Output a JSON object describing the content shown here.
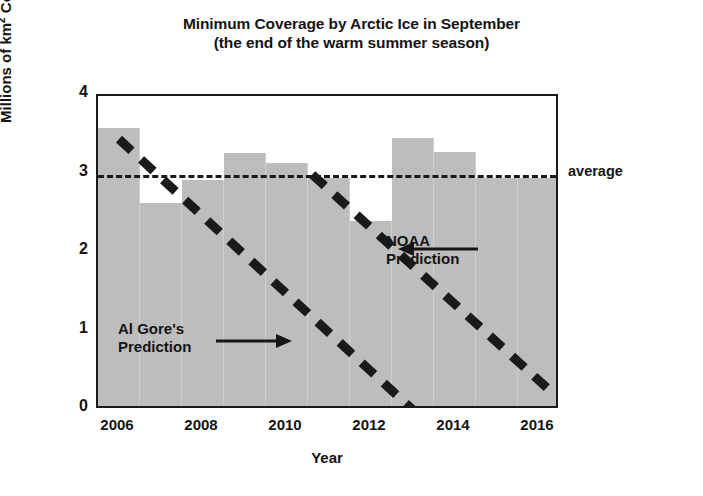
{
  "chart_data": {
    "type": "bar",
    "title": "Minimum Coverage by Arctic Ice in September",
    "subtitle": "(the end of the warm summer season)",
    "xlabel": "Year",
    "ylabel": "Millions of km² Covered",
    "ylim": [
      0,
      4
    ],
    "xlim": [
      2005.5,
      2016.5
    ],
    "grid": false,
    "legend": "none",
    "categories": [
      2006,
      2007,
      2008,
      2009,
      2010,
      2011,
      2012,
      2013,
      2014,
      2015,
      2016
    ],
    "values": [
      3.54,
      2.59,
      2.88,
      3.22,
      3.1,
      2.9,
      2.36,
      3.42,
      3.24,
      2.9,
      2.9
    ],
    "bar_color": "#bdbdbd",
    "series": [
      {
        "name": "Minimum Arctic Ice Coverage",
        "type": "bar",
        "values": [
          3.54,
          2.59,
          2.88,
          3.22,
          3.1,
          2.9,
          2.36,
          3.42,
          3.24,
          2.9,
          2.9
        ]
      },
      {
        "name": "average",
        "type": "hline",
        "value": 3.0,
        "style": "dashed",
        "color": "#1a1a1a"
      },
      {
        "name": "Al Gore's Prediction",
        "type": "line",
        "style": "thick-dashed",
        "color": "#1a1a1a",
        "x": [
          2006,
          2013
        ],
        "y": [
          3.45,
          0.0
        ]
      },
      {
        "name": "NOAA Prediction",
        "type": "line",
        "style": "thick-dashed",
        "color": "#1a1a1a",
        "x": [
          2010.6,
          2016.4
        ],
        "y": [
          3.0,
          0.18
        ]
      }
    ],
    "ytick_labels": [
      "0",
      "1",
      "2",
      "3",
      "4"
    ],
    "ytick_values": [
      0,
      1,
      2,
      3,
      4
    ],
    "xtick_labels": [
      "2006",
      "2008",
      "2010",
      "2012",
      "2014",
      "2016"
    ],
    "xtick_values": [
      2006,
      2008,
      2010,
      2012,
      2014,
      2016
    ],
    "annotations": [
      {
        "name": "average",
        "text": "average",
        "x_px": 568,
        "y_px": 163,
        "arrow": "none"
      },
      {
        "name": "al-gore-prediction",
        "text_line1": "Al Gore's",
        "text_line2": "Prediction",
        "arrow": "right-arrow"
      },
      {
        "name": "noaa-prediction",
        "text_line1": "NOAA",
        "text_line2": "Prediction",
        "arrow": "left-arrow"
      }
    ]
  }
}
